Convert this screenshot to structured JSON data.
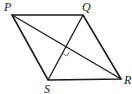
{
  "diagram": {
    "type": "geometry",
    "shape": "rhombus",
    "vertices": [
      {
        "label": "P",
        "x": 12,
        "y": 15,
        "lx": 4,
        "ly": 11
      },
      {
        "label": "Q",
        "x": 83,
        "y": 15,
        "lx": 82,
        "ly": 11
      },
      {
        "label": "R",
        "x": 121,
        "y": 79,
        "lx": 124,
        "ly": 84
      },
      {
        "label": "S",
        "x": 48,
        "y": 80,
        "lx": 44,
        "ly": 93
      }
    ],
    "diagonals": [
      "PR",
      "QS"
    ],
    "right_angle_marker": "diagonal intersection"
  }
}
